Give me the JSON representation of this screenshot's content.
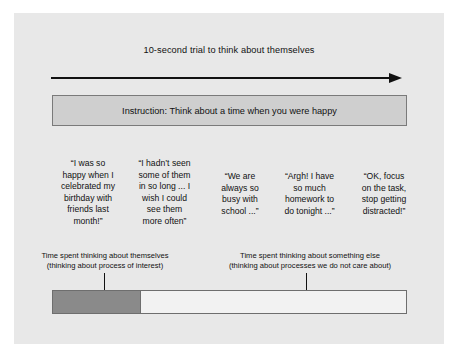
{
  "figure": {
    "timeline": {
      "caption": "10-second trial to think about themselves"
    },
    "instruction": {
      "text": "Instruction: Think about a time when you were happy"
    },
    "quotes": [
      "“I was so\nhappy when I\ncelebrated my\nbirthday with\nfriends last\nmonth!”",
      "“I hadn’t seen\nsome of them\nin so long ... I\nwish I could\nsee them\nmore often”",
      "“We are\nalways so\nbusy with\nschool ...”",
      "“Argh! I have\nso much\nhomework to\ndo tonight ...”",
      "“OK, focus\non the task,\nstop getting\ndistracted!”"
    ],
    "annotations": {
      "left": "Time spent thinking about themselves\n(thinking about process of interest)",
      "right": "Time spent thinking about something else\n(thinking about processes we do not care about)"
    },
    "bar": {
      "filled_percent": 25,
      "filled_color": "#8a8a8a",
      "empty_color": "#f2f2f2",
      "border_color": "#6e6e6e"
    },
    "colors": {
      "panel_background": "#e8e8e8",
      "instruction_fill": "#cfcfcf",
      "instruction_border": "#7a7a7a",
      "ink": "#111111"
    }
  }
}
